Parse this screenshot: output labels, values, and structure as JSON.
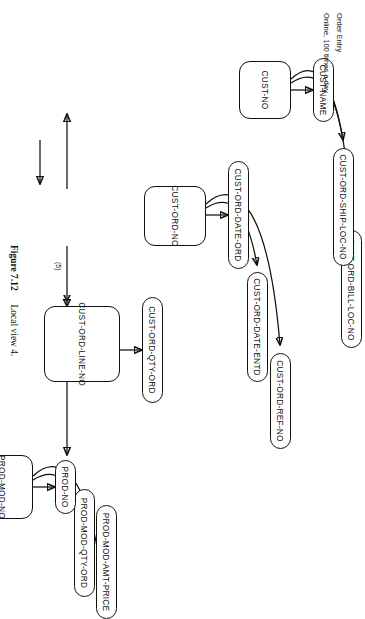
{
  "figure": {
    "number": "Figure 7.12",
    "caption": "Local view 4.",
    "notes": [
      "Order Entry",
      "Online, 100 times a day"
    ]
  },
  "diagram": {
    "type": "bachman-data-structure-diagram",
    "nodes": [
      {
        "id": "cust-no",
        "label": "CUST-NO",
        "row": 0,
        "col": 0
      },
      {
        "id": "cust-name",
        "label": "CUST-NAME",
        "row": 0,
        "col": 1
      },
      {
        "id": "cust-ord-ship-loc-no",
        "label": "CUST-ORD-SHIP-LOC-NO",
        "row": 0,
        "col": 2
      },
      {
        "id": "cust-ord-bill-loc-no",
        "label": "CUST-ORD-BILL-LOC-NO",
        "row": 0,
        "col": 3
      },
      {
        "id": "cust-ord-no",
        "label": "CUST-ORD-NO",
        "row": 1,
        "col": 0
      },
      {
        "id": "cust-ord-date-ord",
        "label": "CUST-ORD-DATE-ORD",
        "row": 1,
        "col": 1
      },
      {
        "id": "cust-ord-date-entd",
        "label": "CUST-ORD-DATE-ENTD",
        "row": 1,
        "col": 2
      },
      {
        "id": "cust-ord-ref-no",
        "label": "CUST-ORD-REF-NO",
        "row": 1,
        "col": 3
      },
      {
        "id": "cust-ord-line-no",
        "label": "CUST-ORD-LINE-NO",
        "row": 2,
        "col": 0
      },
      {
        "id": "cust-ord-qty-ord",
        "label": "CUST-ORD-QTY-ORD",
        "row": 2,
        "col": 1
      },
      {
        "id": "prod-mod-no",
        "label": "PROD-MOD-NO",
        "row": 3,
        "col": 0
      },
      {
        "id": "prod-no",
        "label": "PROD-NO",
        "row": 3,
        "col": 1
      },
      {
        "id": "prod-mod-qty-ord",
        "label": "PROD-MOD-QTY-ORD",
        "row": 3,
        "col": 2
      },
      {
        "id": "prod-mod-amt-price",
        "label": "PROD-MOD-AMT-PRICE",
        "row": 3,
        "col": 3
      }
    ],
    "edges": [
      {
        "from": "cust-no",
        "to": "cust-name",
        "style": "straight"
      },
      {
        "from": "cust-no",
        "to": "cust-ord-ship-loc-no",
        "style": "curved"
      },
      {
        "from": "cust-no",
        "to": "cust-ord-bill-loc-no",
        "style": "curved"
      },
      {
        "from": "cust-ord-no",
        "to": "cust-ord-date-ord",
        "style": "straight"
      },
      {
        "from": "cust-ord-no",
        "to": "cust-ord-date-entd",
        "style": "curved"
      },
      {
        "from": "cust-ord-no",
        "to": "cust-ord-ref-no",
        "style": "curved"
      },
      {
        "from": "cust-ord-line-no",
        "to": "cust-ord-qty-ord",
        "style": "straight"
      },
      {
        "from": "prod-mod-no",
        "to": "prod-no",
        "style": "straight"
      },
      {
        "from": "prod-mod-no",
        "to": "prod-mod-qty-ord",
        "style": "curved"
      },
      {
        "from": "prod-mod-no",
        "to": "prod-mod-amt-price",
        "style": "curved"
      },
      {
        "from": "cust-ord-no",
        "to": "cust-no",
        "style": "straight"
      },
      {
        "from": "cust-ord-no",
        "to": "cust-ord-line-no",
        "style": "double-arrow",
        "label": "(5)"
      },
      {
        "from": "cust-ord-line-no",
        "to": "prod-mod-no",
        "style": "straight"
      },
      {
        "from": "entry",
        "to": "cust-ord-no",
        "style": "entry"
      }
    ],
    "edge_labels": [
      "(5)"
    ]
  }
}
